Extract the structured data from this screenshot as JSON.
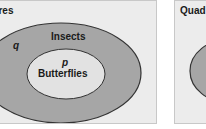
{
  "diagram": {
    "type": "venn-nested",
    "colors": {
      "panel_bg": "#ececec",
      "panel_border": "#c8c8c8",
      "outer_fill": "#a6a6a6",
      "inner_fill": "#e2e2e2",
      "outline": "#333333",
      "text": "#1a1a1a"
    },
    "left_panel": {
      "title": "tures",
      "outer_set": {
        "label": "Insects",
        "variable": "q"
      },
      "inner_set": {
        "label": "Butterflies",
        "variable": "p"
      }
    },
    "right_panel": {
      "title": "Quad"
    }
  }
}
